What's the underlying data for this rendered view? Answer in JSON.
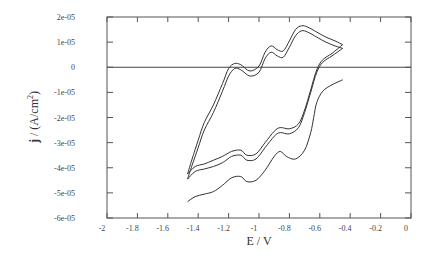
{
  "chart_data": {
    "type": "line",
    "title": "",
    "xlabel": "E / V",
    "ylabel_bold": "j",
    "ylabel_rest": " / (A/cm",
    "ylabel_sup": "2",
    "ylabel_close": ")",
    "xlim": [
      -2,
      0
    ],
    "ylim": [
      -6e-05,
      2e-05
    ],
    "grid": false,
    "legend": "none",
    "x_ticks": [
      -2,
      -1.8,
      -1.6,
      -1.4,
      -1.2,
      -1,
      -0.8,
      -0.6,
      -0.4,
      -0.2,
      0
    ],
    "x_tick_labels": [
      "-2",
      "-1.8",
      "-1.6",
      "-1.4",
      "-1.2",
      "-1",
      "-0.8",
      "-0.6",
      "-0.4",
      "-0.2",
      "0"
    ],
    "y_ticks": [
      2e-05,
      1e-05,
      0,
      -1e-05,
      -2e-05,
      -3e-05,
      -4e-05,
      -5e-05,
      -6e-05
    ],
    "y_tick_labels": [
      "2e-05",
      "1e-05",
      "0",
      "-1e-05",
      "-2e-05",
      "-3e-05",
      "-4e-05",
      "-5e-05",
      "-6e-05"
    ],
    "zero_line": true,
    "series": [
      {
        "name": "cycle 1 (first scan, cathodic sweep)",
        "x": [
          -0.45,
          -0.52,
          -0.58,
          -0.62,
          -0.64,
          -0.66,
          -0.7,
          -0.76,
          -0.82,
          -0.86,
          -0.9,
          -0.96,
          -1.02,
          -1.08,
          -1.12,
          -1.18,
          -1.24,
          -1.3,
          -1.36,
          -1.42,
          -1.47
        ],
        "y": [
          -5e-06,
          -7e-06,
          -9.5e-06,
          -1.4e-05,
          -2e-05,
          -2.6e-05,
          -3.3e-05,
          -3.65e-05,
          -3.55e-05,
          -3.35e-05,
          -3.55e-05,
          -4.1e-05,
          -4.5e-05,
          -4.55e-05,
          -4.35e-05,
          -4.4e-05,
          -4.7e-05,
          -4.95e-05,
          -5.05e-05,
          -5.15e-05,
          -5.35e-05
        ]
      },
      {
        "name": "cycle 2 (cathodic sweep)",
        "x": [
          -0.45,
          -0.52,
          -0.58,
          -0.62,
          -0.66,
          -0.7,
          -0.74,
          -0.8,
          -0.86,
          -0.9,
          -0.96,
          -1.02,
          -1.08,
          -1.12,
          -1.18,
          -1.24,
          -1.3,
          -1.36,
          -1.42,
          -1.47
        ],
        "y": [
          7.5e-06,
          4.5e-06,
          2e-06,
          -2e-06,
          -1e-05,
          -1.8e-05,
          -2.4e-05,
          -2.65e-05,
          -2.6e-05,
          -2.75e-05,
          -3.2e-05,
          -3.65e-05,
          -3.7e-05,
          -3.5e-05,
          -3.55e-05,
          -3.8e-05,
          -3.95e-05,
          -4.05e-05,
          -4.15e-05,
          -4.45e-05
        ]
      },
      {
        "name": "cycle 3 (cathodic sweep)",
        "x": [
          -0.45,
          -0.52,
          -0.58,
          -0.62,
          -0.66,
          -0.7,
          -0.74,
          -0.8,
          -0.86,
          -0.9,
          -0.96,
          -1.02,
          -1.08,
          -1.12,
          -1.18,
          -1.24,
          -1.3,
          -1.36,
          -1.42,
          -1.47
        ],
        "y": [
          9e-06,
          5.5e-06,
          3e-06,
          -1e-06,
          -9e-06,
          -1.7e-05,
          -2.25e-05,
          -2.45e-05,
          -2.4e-05,
          -2.55e-05,
          -3e-05,
          -3.45e-05,
          -3.5e-05,
          -3.3e-05,
          -3.35e-05,
          -3.55e-05,
          -3.7e-05,
          -3.85e-05,
          -3.95e-05,
          -4.25e-05
        ]
      },
      {
        "name": "cycle 2 (anodic sweep)",
        "x": [
          -1.47,
          -1.44,
          -1.4,
          -1.36,
          -1.3,
          -1.24,
          -1.2,
          -1.16,
          -1.12,
          -1.06,
          -1.0,
          -0.96,
          -0.92,
          -0.88,
          -0.84,
          -0.8,
          -0.76,
          -0.72,
          -0.68,
          -0.62,
          -0.56,
          -0.5,
          -0.45
        ],
        "y": [
          -4.45e-05,
          -3.9e-05,
          -3.2e-05,
          -2.5e-05,
          -1.8e-05,
          -9.5e-06,
          -3.5e-06,
          -5e-07,
          -1e-06,
          -3.5e-06,
          -2e-06,
          3.5e-06,
          6e-06,
          4.5e-06,
          4e-06,
          8e-06,
          1.25e-05,
          1.45e-05,
          1.4e-05,
          1.2e-05,
          1e-05,
          8.5e-06,
          7.5e-06
        ]
      },
      {
        "name": "cycle 3 (anodic sweep)",
        "x": [
          -1.47,
          -1.44,
          -1.4,
          -1.36,
          -1.3,
          -1.24,
          -1.2,
          -1.16,
          -1.12,
          -1.06,
          -1.0,
          -0.96,
          -0.92,
          -0.88,
          -0.84,
          -0.8,
          -0.76,
          -0.72,
          -0.68,
          -0.62,
          -0.56,
          -0.5,
          -0.45
        ],
        "y": [
          -4.25e-05,
          -3.65e-05,
          -2.9e-05,
          -2.2e-05,
          -1.5e-05,
          -6.5e-06,
          -5e-07,
          1.5e-06,
          1e-06,
          -1.5e-06,
          5e-07,
          6e-06,
          8.5e-06,
          7e-06,
          6.5e-06,
          1.05e-05,
          1.5e-05,
          1.65e-05,
          1.6e-05,
          1.4e-05,
          1.2e-05,
          1.05e-05,
          9e-06
        ]
      }
    ]
  }
}
